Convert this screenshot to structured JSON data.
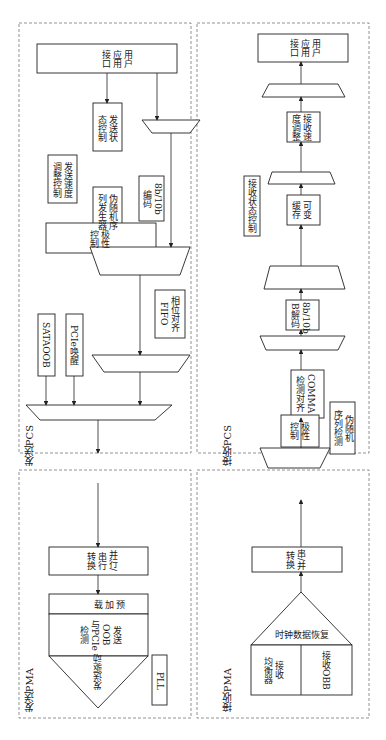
{
  "diagram": {
    "orientation": "rotated-90",
    "regions": {
      "tx_pcs": "发送PCS",
      "tx_pma": "发送PMA",
      "rx_pcs": "接收PCS",
      "rx_pma": "接收PMA"
    },
    "tx_pcs_blocks": {
      "user_interface": "用户\n应用\n接口",
      "tx_state_ctrl": "发送状\n态控制",
      "tx_rate_adjust": "发送速度\n调整控制",
      "prbs_gen": "伪随机序\n列发生器",
      "enc_8b10b": "8b/10b\n编码",
      "phase_fifo": "相位对齐\nFIFO",
      "sata_oob": "SATAOOB",
      "pcie_wake": "PCIe唤醒",
      "polarity": "极性\n控制"
    },
    "tx_pma_blocks": {
      "par_to_ser": "并行/\n串行\n转换",
      "preemphasis": "预\n加\n载",
      "tx_oob_pcie": "发送\nOOB\n与PCIe\n检测",
      "tx_driver": "发送驱动",
      "pll": "PLL"
    },
    "rx_pcs_blocks": {
      "user_interface": "用户\n应用\n接口",
      "rx_rate_adjust": "接收速\n度调整",
      "rx_state_ctrl": "接收状态控制",
      "elastic_buffer": "可变\n缓存",
      "dec_8b10b": "8b/10b\nB解码",
      "comma_align": "COMMA\n检测对齐",
      "prbs_check": "伪随机\n序列检测",
      "polarity": "极性\n控制"
    },
    "rx_pma_blocks": {
      "ser_to_par": "串/并\n转换",
      "cdr": "时钟数据恢复",
      "rx_equalizer": "接收\n均衡器",
      "rx_oob": "接收OBB"
    }
  }
}
